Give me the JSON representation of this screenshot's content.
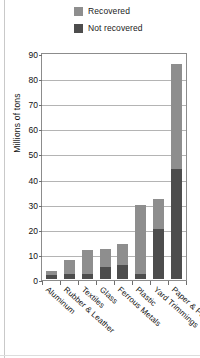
{
  "chart_data": {
    "type": "bar",
    "subtype": "stacked-vertical",
    "title": "",
    "xlabel": "",
    "ylabel": "Millions of tons",
    "ylim": [
      0,
      90
    ],
    "ytick_step": 10,
    "ytick_labels": [
      "90",
      "80",
      "70",
      "60",
      "50",
      "40",
      "30",
      "20",
      "10",
      "0"
    ],
    "grid": true,
    "legend_position": "top-right",
    "categories": [
      "Aluminum",
      "Rubber & Leather",
      "Textiles",
      "Glass",
      "Ferrous Metals",
      "Plastic",
      "Yard Trimmings",
      "Paper & Paperboard"
    ],
    "series": [
      {
        "name": "Not recovered",
        "color": "#4d4d4d",
        "values": [
          1.5,
          1.8,
          2.0,
          4.6,
          5.5,
          2.0,
          20.0,
          44.0
        ]
      },
      {
        "name": "Recovered",
        "color": "#8e8e8e",
        "values": [
          1.5,
          5.7,
          9.5,
          7.4,
          8.5,
          27.5,
          12.0,
          41.5
        ]
      }
    ],
    "totals": [
      3.0,
      7.5,
      11.5,
      12.0,
      14.0,
      29.5,
      32.0,
      85.5
    ]
  },
  "legend": {
    "items": [
      {
        "label": "Recovered",
        "color": "#8e8e8e"
      },
      {
        "label": "Not recovered",
        "color": "#4d4d4d"
      }
    ]
  }
}
